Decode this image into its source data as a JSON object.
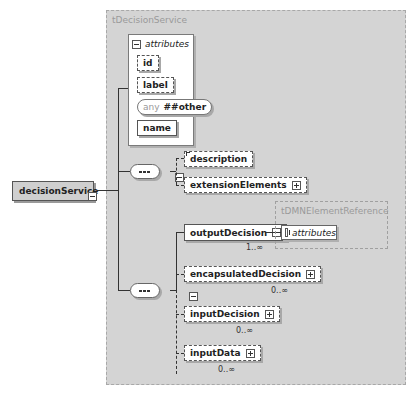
{
  "frames": {
    "outer_type": "tDecisionService",
    "ref_type": "tDMNElementReference"
  },
  "root": {
    "name": "decisionService",
    "toggle": "collapse"
  },
  "attributes": {
    "title": "attributes",
    "toggle": "collapse",
    "items": [
      {
        "name": "id",
        "style": "optional"
      },
      {
        "name": "label",
        "style": "optional"
      },
      {
        "name": "##other",
        "prefix": "any",
        "style": "wildcard"
      },
      {
        "name": "name",
        "style": "required"
      }
    ]
  },
  "sequence1": {
    "children": [
      {
        "name": "description",
        "style": "optional",
        "toggle": null
      },
      {
        "name": "extensionElements",
        "style": "optional",
        "toggle": "expand"
      }
    ]
  },
  "sequence2": {
    "children": [
      {
        "name": "outputDecision",
        "style": "required",
        "toggle": "collapse",
        "cardinality": "1..∞"
      },
      {
        "name": "encapsulatedDecision",
        "style": "optional",
        "toggle": "expand",
        "cardinality": "0..∞"
      },
      {
        "name": "inputDecision",
        "style": "optional",
        "toggle": "expand",
        "cardinality": "0..∞"
      },
      {
        "name": "inputData",
        "style": "optional",
        "toggle": "expand",
        "cardinality": "0..∞"
      }
    ]
  },
  "ref_attributes": {
    "title": "attributes",
    "toggle": "expand"
  }
}
